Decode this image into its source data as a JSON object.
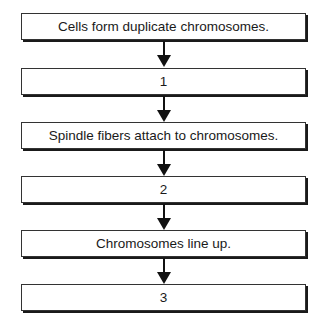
{
  "flowchart": {
    "steps": [
      {
        "label": "Cells form duplicate chromosomes."
      },
      {
        "label": "1"
      },
      {
        "label": "Spindle fibers attach to chromosomes."
      },
      {
        "label": "2"
      },
      {
        "label": "Chromosomes line up."
      },
      {
        "label": "3"
      }
    ],
    "arrow_icon": "down-arrow-icon",
    "colors": {
      "line": "#111111",
      "box_fill": "#ffffff",
      "text": "#1a1a1a"
    }
  }
}
